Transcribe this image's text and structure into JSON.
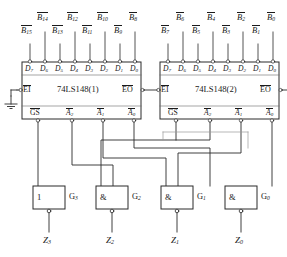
{
  "diagram": {
    "ink_color": "#1a1a1a",
    "background": "#ffffff"
  },
  "chips": [
    {
      "id": "chip1",
      "name": "74LS148(1)",
      "data_pins": [
        {
          "pin": "D7",
          "signal": "B15"
        },
        {
          "pin": "D6",
          "signal": "B14"
        },
        {
          "pin": "D5",
          "signal": "B13"
        },
        {
          "pin": "D4",
          "signal": "B12"
        },
        {
          "pin": "D3",
          "signal": "B11"
        },
        {
          "pin": "D2",
          "signal": "B10"
        },
        {
          "pin": "D1",
          "signal": "B9"
        },
        {
          "pin": "D0",
          "signal": "B8"
        }
      ],
      "enable_in": "EI",
      "enable_out": "EO",
      "outputs": [
        "GS",
        "A2",
        "A1",
        "A0"
      ]
    },
    {
      "id": "chip2",
      "name": "74LS148(2)",
      "data_pins": [
        {
          "pin": "D7",
          "signal": "B7"
        },
        {
          "pin": "D6",
          "signal": "B6"
        },
        {
          "pin": "D5",
          "signal": "B5"
        },
        {
          "pin": "D4",
          "signal": "B4"
        },
        {
          "pin": "D3",
          "signal": "B3"
        },
        {
          "pin": "D2",
          "signal": "B2"
        },
        {
          "pin": "D1",
          "signal": "B1"
        },
        {
          "pin": "D0",
          "signal": "B0"
        }
      ],
      "enable_in": "EI",
      "enable_out": "EO",
      "outputs": [
        "GS",
        "A2",
        "A1",
        "A0"
      ]
    }
  ],
  "pin_labels": {
    "d7": "D",
    "d7s": "7",
    "d6": "D",
    "d6s": "6",
    "d5": "D",
    "d5s": "5",
    "d4": "D",
    "d4s": "4",
    "d3": "D",
    "d3s": "3",
    "d2": "D",
    "d2s": "2",
    "d1": "D",
    "d1s": "1",
    "d0": "D",
    "d0s": "0"
  },
  "inputs_top": {
    "chip1_upper": [
      {
        "base": "B",
        "sub": "14"
      },
      {
        "base": "B",
        "sub": "12"
      },
      {
        "base": "B",
        "sub": "10"
      },
      {
        "base": "B",
        "sub": "8"
      }
    ],
    "chip1_lower": [
      {
        "base": "B",
        "sub": "15"
      },
      {
        "base": "B",
        "sub": "13"
      },
      {
        "base": "B",
        "sub": "11"
      },
      {
        "base": "B",
        "sub": "9"
      }
    ],
    "chip2_upper": [
      {
        "base": "B",
        "sub": "6"
      },
      {
        "base": "B",
        "sub": "4"
      },
      {
        "base": "B",
        "sub": "2"
      },
      {
        "base": "B",
        "sub": "0"
      }
    ],
    "chip2_lower": [
      {
        "base": "B",
        "sub": "7"
      },
      {
        "base": "B",
        "sub": "5"
      },
      {
        "base": "B",
        "sub": "3"
      },
      {
        "base": "B",
        "sub": "1"
      }
    ]
  },
  "outputs_bottom": {
    "gs": "GS",
    "a2": "A",
    "a2s": "2",
    "a1": "A",
    "a1s": "1",
    "a0": "A",
    "a0s": "0"
  },
  "gates": [
    {
      "id": "G3",
      "name": "G",
      "sub": "3",
      "symbol": "1",
      "type": "inverter",
      "output": "Z",
      "out_sub": "3",
      "inverting": true
    },
    {
      "id": "G2",
      "name": "G",
      "sub": "2",
      "symbol": "&",
      "type": "nand",
      "output": "Z",
      "out_sub": "2",
      "inverting": true
    },
    {
      "id": "G1",
      "name": "G",
      "sub": "1",
      "symbol": "&",
      "type": "nand",
      "output": "Z",
      "out_sub": "1",
      "inverting": true
    },
    {
      "id": "G0",
      "name": "G",
      "sub": "0",
      "symbol": "&",
      "type": "nand",
      "output": "Z",
      "out_sub": "0",
      "inverting": true
    }
  ],
  "outputs_z": [
    {
      "base": "Z",
      "sub": "3"
    },
    {
      "base": "Z",
      "sub": "2"
    },
    {
      "base": "Z",
      "sub": "1"
    },
    {
      "base": "Z",
      "sub": "0"
    }
  ],
  "ground": {
    "symbol": "GND",
    "attached_to": "EI of 74LS148(1)"
  }
}
